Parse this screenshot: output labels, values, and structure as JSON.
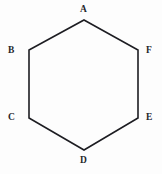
{
  "figure": {
    "type": "polygon",
    "shape_name": "hexagon",
    "orientation": "pointy-top",
    "sides": 6,
    "canvas": {
      "width": 162,
      "height": 174,
      "background_color": "#fdfdfd"
    },
    "stroke": {
      "color": "#1d1d22",
      "width": 1.6,
      "linejoin": "miter",
      "fill": "none"
    },
    "label_style": {
      "color": "#26262b",
      "font_size_px": 9.5,
      "weight": "bold"
    },
    "vertices": [
      {
        "id": "A",
        "label": "A",
        "x": 84,
        "y": 20,
        "position": "top",
        "label_x": 84,
        "label_y": 10
      },
      {
        "id": "B",
        "label": "B",
        "x": 29,
        "y": 50,
        "position": "upper-left",
        "label_x": 12,
        "label_y": 51
      },
      {
        "id": "C",
        "label": "C",
        "x": 29,
        "y": 118,
        "position": "lower-left",
        "label_x": 12,
        "label_y": 118
      },
      {
        "id": "D",
        "label": "D",
        "x": 84,
        "y": 150,
        "position": "bottom",
        "label_x": 84,
        "label_y": 161
      },
      {
        "id": "E",
        "label": "E",
        "x": 138,
        "y": 118,
        "position": "lower-right",
        "label_x": 150,
        "label_y": 118
      },
      {
        "id": "F",
        "label": "F",
        "x": 138,
        "y": 50,
        "position": "upper-right",
        "label_x": 150,
        "label_y": 51
      }
    ],
    "edges": [
      {
        "from": "A",
        "to": "F"
      },
      {
        "from": "F",
        "to": "E"
      },
      {
        "from": "E",
        "to": "D"
      },
      {
        "from": "D",
        "to": "C"
      },
      {
        "from": "C",
        "to": "B"
      },
      {
        "from": "B",
        "to": "A"
      }
    ],
    "points_attr": "84,20 138,50 138,118 84,150 29,118 29,50"
  }
}
